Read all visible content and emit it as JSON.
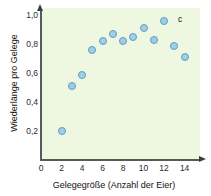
{
  "panel": {
    "label": "c"
  },
  "axes": {
    "x": {
      "title": "Gelegegröße (Anzahl der Eier)",
      "ticks": [
        "0",
        "2",
        "4",
        "6",
        "8",
        "10",
        "12",
        "14"
      ],
      "tick_values": [
        0,
        2,
        4,
        6,
        8,
        10,
        12,
        14
      ],
      "min": 0,
      "max": 15.5
    },
    "y": {
      "title": "Wiederlänge pro Gelege",
      "ticks": [
        "0,2",
        "0,4",
        "0,6",
        "0,8",
        "1,0"
      ],
      "tick_values": [
        0.2,
        0.4,
        0.6,
        0.8,
        1.0
      ],
      "min": 0.0,
      "max": 1.05
    }
  },
  "colors": {
    "plot_background": "#eef7e0",
    "marker_fill": "#a3cde0",
    "marker_stroke": "#5f9ec4",
    "axis": "#555b55",
    "text": "#111111"
  },
  "chart_data": {
    "type": "scatter",
    "title": "",
    "subtitle": "",
    "xlabel": "Gelegegröße (Anzahl der Eier)",
    "ylabel": "Wiederlänge pro Gelege",
    "xlim": [
      0,
      15.5
    ],
    "ylim": [
      0.0,
      1.05
    ],
    "grid": false,
    "legend": false,
    "annotations": [
      {
        "text": "c",
        "position": "top-right"
      }
    ],
    "x": [
      2,
      3,
      4,
      5,
      6,
      7,
      8,
      9,
      10,
      11,
      12,
      13,
      14
    ],
    "y": [
      0.2,
      0.51,
      0.59,
      0.76,
      0.82,
      0.87,
      0.82,
      0.85,
      0.91,
      0.83,
      0.96,
      0.79,
      0.71
    ],
    "points": [
      {
        "x": 2,
        "y": 0.2
      },
      {
        "x": 3,
        "y": 0.51
      },
      {
        "x": 4,
        "y": 0.59
      },
      {
        "x": 5,
        "y": 0.76
      },
      {
        "x": 6,
        "y": 0.82
      },
      {
        "x": 7,
        "y": 0.87
      },
      {
        "x": 8,
        "y": 0.82
      },
      {
        "x": 9,
        "y": 0.85
      },
      {
        "x": 10,
        "y": 0.91
      },
      {
        "x": 11,
        "y": 0.83
      },
      {
        "x": 12,
        "y": 0.96
      },
      {
        "x": 13,
        "y": 0.79
      },
      {
        "x": 14,
        "y": 0.71
      }
    ]
  }
}
